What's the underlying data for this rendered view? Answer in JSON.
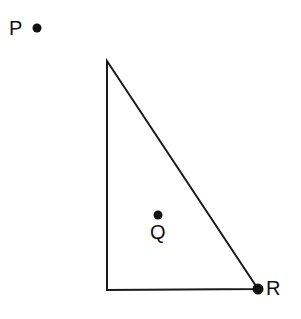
{
  "figure": {
    "background_color": "#ffffff",
    "stroke_color": "#1a1a1a",
    "stroke_width": 2,
    "width": 301,
    "height": 319
  },
  "triangle": {
    "name": "right-triangle",
    "vertices": [
      {
        "name": "apex",
        "x": 107,
        "y": 61
      },
      {
        "name": "right-angle-corner",
        "x": 107,
        "y": 290
      },
      {
        "name": "bottom-right",
        "x": 258,
        "y": 289
      }
    ],
    "edges": [
      {
        "name": "left-leg",
        "from": "apex",
        "to": "right-angle-corner"
      },
      {
        "name": "bottom-leg",
        "from": "right-angle-corner",
        "to": "bottom-right"
      },
      {
        "name": "hypotenuse",
        "from": "apex",
        "to": "bottom-right"
      }
    ]
  },
  "points": [
    {
      "id": "P",
      "label": "P",
      "dot": {
        "cx": 37,
        "cy": 28,
        "r": 4.5
      },
      "label_position": "left",
      "inside_triangle": false
    },
    {
      "id": "Q",
      "label": "Q",
      "dot": {
        "cx": 158,
        "cy": 215,
        "r": 4.5
      },
      "label_position": "below",
      "inside_triangle": true
    },
    {
      "id": "R",
      "label": "R",
      "dot": {
        "cx": 258,
        "cy": 289,
        "r": 5.5
      },
      "label_position": "right",
      "inside_triangle": false,
      "is_triangle_vertex": true
    }
  ]
}
